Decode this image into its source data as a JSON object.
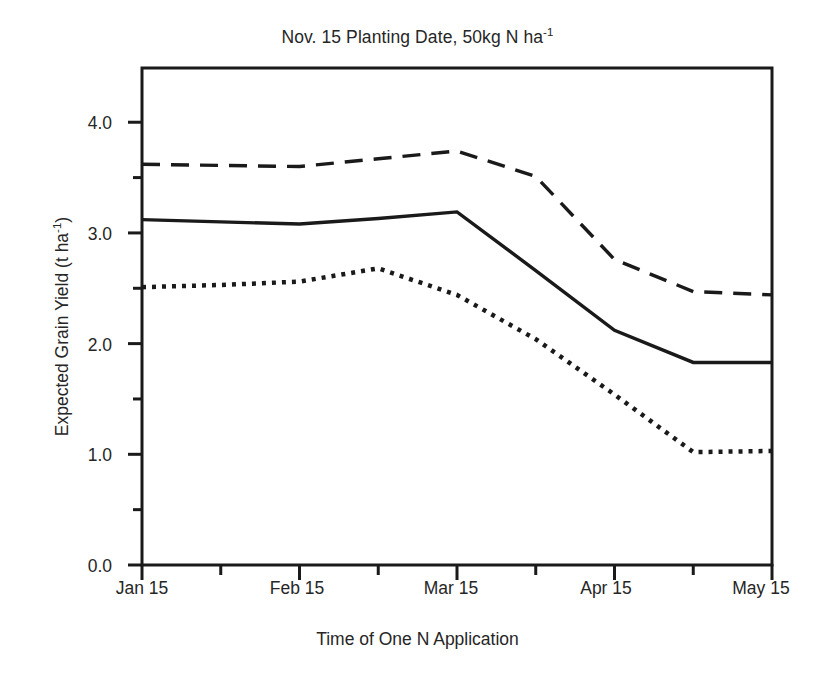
{
  "chart_data": {
    "type": "line",
    "title": "Nov. 15 Planting Date, 50kg N ha-1",
    "title_main": "Nov. 15 Planting Date, 50kg N ha",
    "title_sup": "-1",
    "xlabel": "Time of One N Application",
    "ylabel_main": "Expected Grain Yield (t ha",
    "ylabel_sup": "-1",
    "ylabel_tail": ")",
    "ylabel": "Expected Grain Yield (t ha-1)",
    "grid": false,
    "legend": "none",
    "ylim": [
      0.0,
      4.49
    ],
    "xlim": [
      "Jan 15",
      "May 15"
    ],
    "ytick_labels": [
      "0.0",
      "1.0",
      "2.0",
      "3.0",
      "4.0"
    ],
    "ytick_values": [
      0.0,
      1.0,
      2.0,
      3.0,
      4.0
    ],
    "yminor_values": [
      0.5,
      1.5,
      2.5,
      3.5
    ],
    "xtick_labels": [
      "Jan 15",
      "Feb 15",
      "Mar 15",
      "Apr 15",
      "May 15"
    ],
    "xminor_labels": [
      "Feb 1",
      "Mar 1",
      "Apr 1",
      "Apr 30"
    ],
    "x": [
      "Jan 15",
      "Feb 1",
      "Feb 15",
      "Mar 1",
      "Mar 15",
      "Apr 1",
      "Apr 15",
      "Apr 30",
      "May 15"
    ],
    "x_numeric": [
      0,
      1,
      2,
      3,
      4,
      5,
      6,
      7,
      8
    ],
    "series": [
      {
        "name": "upper-dashed",
        "style": "dashed",
        "color": "#1a1a1a",
        "values": [
          3.62,
          3.61,
          3.6,
          3.67,
          3.74,
          3.51,
          2.76,
          2.47,
          2.44
        ]
      },
      {
        "name": "middle-solid",
        "style": "solid",
        "color": "#1a1a1a",
        "values": [
          3.12,
          3.1,
          3.08,
          3.13,
          3.19,
          2.66,
          2.12,
          1.83,
          1.83
        ]
      },
      {
        "name": "lower-dotted",
        "style": "dotted",
        "color": "#1a1a1a",
        "values": [
          2.51,
          2.53,
          2.56,
          2.68,
          2.44,
          2.04,
          1.54,
          1.02,
          1.03
        ]
      }
    ]
  },
  "axes": {
    "frame_color": "#1a1a1a"
  }
}
